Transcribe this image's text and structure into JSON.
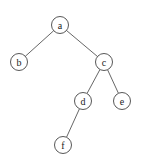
{
  "diagram": {
    "type": "binary-tree",
    "nodes": [
      {
        "id": "a",
        "label": "a",
        "x": 60,
        "y": 25
      },
      {
        "id": "b",
        "label": "b",
        "x": 19,
        "y": 62
      },
      {
        "id": "c",
        "label": "c",
        "x": 104,
        "y": 62
      },
      {
        "id": "d",
        "label": "d",
        "x": 83,
        "y": 101
      },
      {
        "id": "e",
        "label": "e",
        "x": 122,
        "y": 101
      },
      {
        "id": "f",
        "label": "f",
        "x": 63,
        "y": 145
      }
    ],
    "edges": [
      {
        "from": "a",
        "to": "b"
      },
      {
        "from": "a",
        "to": "c"
      },
      {
        "from": "c",
        "to": "d"
      },
      {
        "from": "c",
        "to": "e"
      },
      {
        "from": "d",
        "to": "f"
      }
    ],
    "node_radius": 8.5
  }
}
